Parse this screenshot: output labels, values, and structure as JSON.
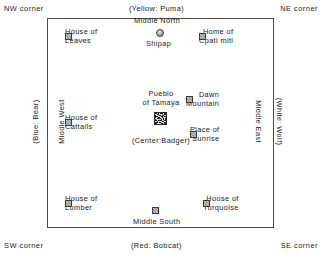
{
  "figure": {
    "boundary_shape": "square",
    "line_color": "#4a4a4a",
    "background": "#ffffff",
    "text_color": "#1a1a1a"
  },
  "corners": {
    "nw": "NW corner",
    "ne": "NE corner",
    "sw": "SW corner",
    "se": "SE corner"
  },
  "cardinal_clans": {
    "north": "(Yellow: Puma)",
    "south": "(Red: Bobcat)",
    "west": "(Blue: Bear)",
    "east": "(White: Wolf)"
  },
  "middles": {
    "north": "Middle North",
    "south": "Middle South",
    "west": "Middle West",
    "east": "Middle East"
  },
  "center": {
    "name_line1": "Pueblo",
    "name_line2": "of Tamaya",
    "clan": "(Center:Badger)",
    "icon": "pueblo-glyph-icon"
  },
  "places": [
    {
      "id": "shipap",
      "label": "Shipap",
      "icon": "circle-marker-icon",
      "position": "middle-north"
    },
    {
      "id": "house-of-leaves",
      "line1": "House of",
      "line2": "Leaves",
      "icon": "square-marker-icon",
      "position": "northwest"
    },
    {
      "id": "home-of-cpati-miti",
      "line1": "Home of",
      "line2": "Cpati miti",
      "icon": "square-marker-icon",
      "position": "northeast"
    },
    {
      "id": "house-of-cattails",
      "line1": "House of",
      "line2": "Cattails",
      "icon": "square-marker-icon",
      "position": "west"
    },
    {
      "id": "dawn-mountain",
      "line1": "Dawn",
      "line2": "Mountain",
      "icon": "square-marker-icon",
      "position": "east-upper"
    },
    {
      "id": "place-of-sunrise",
      "line1": "Place of",
      "line2": "Sunrise",
      "icon": "square-marker-icon",
      "position": "east-lower"
    },
    {
      "id": "house-of-lumber",
      "line1": "House of",
      "line2": "Lumber",
      "icon": "square-marker-icon",
      "position": "southwest"
    },
    {
      "id": "house-of-turquoise",
      "line1": "House of",
      "line2": "Turquoise",
      "icon": "square-marker-icon",
      "position": "southeast"
    }
  ]
}
